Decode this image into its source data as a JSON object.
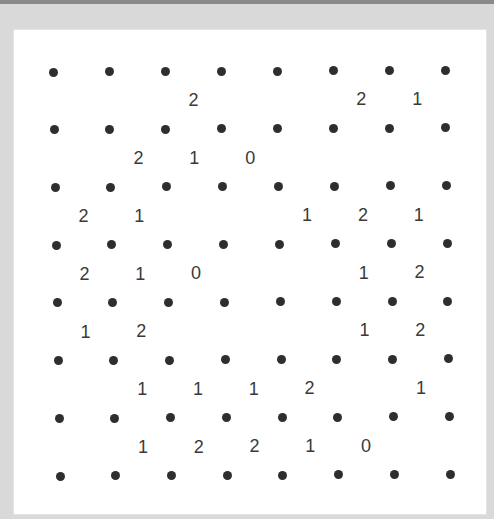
{
  "puzzle": {
    "type": "slitherlink",
    "dot_rows": 8,
    "dot_cols": 8,
    "cell_rows": 7,
    "cell_cols": 7,
    "clues": [
      [
        "",
        "",
        "2",
        "",
        "",
        "2",
        "1"
      ],
      [
        "",
        "2",
        "1",
        "0",
        "",
        "",
        ""
      ],
      [
        "2",
        "1",
        "",
        "",
        "1",
        "2",
        "1"
      ],
      [
        "2",
        "1",
        "0",
        "",
        "",
        "1",
        "2"
      ],
      [
        "1",
        "2",
        "",
        "",
        "",
        "1",
        "2"
      ],
      [
        "",
        "1",
        "1",
        "1",
        "2",
        "",
        "1"
      ],
      [
        "",
        "1",
        "2",
        "2",
        "1",
        "0",
        ""
      ]
    ]
  },
  "colors": {
    "background": "#d9d9d9",
    "board": "#ffffff",
    "dot": "#2e2e2e",
    "clue_text": "#3a3a3a"
  }
}
